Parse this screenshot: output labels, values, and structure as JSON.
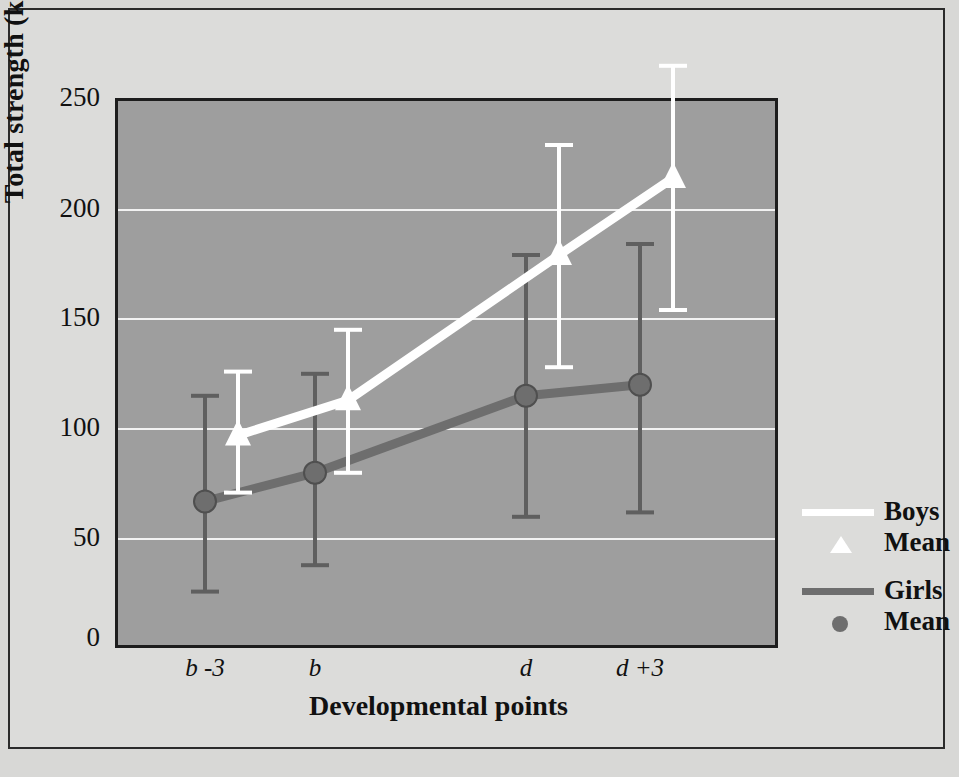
{
  "chart_data": {
    "type": "line",
    "title": "",
    "xlabel": "Developmental points",
    "ylabel": "Total strength (kg)",
    "categories": [
      "b -3",
      "b",
      "d",
      "d +3"
    ],
    "ylim": [
      0,
      250
    ],
    "yticks": [
      0,
      50,
      100,
      150,
      200,
      250
    ],
    "grid": "horizontal-white-dotted",
    "legend_position": "right",
    "plot_background": "#9e9e9e",
    "series": [
      {
        "name": "Boys",
        "marker": "triangle",
        "marker_label": "Mean",
        "color": "#ffffff",
        "values": [
          93,
          109,
          175,
          210
        ],
        "error_low": [
          67,
          76,
          124,
          150
        ],
        "error_high": [
          122,
          141,
          225,
          261
        ]
      },
      {
        "name": "Girls",
        "marker": "circle",
        "marker_label": "Mean",
        "color": "#6e6e6e",
        "values": [
          63,
          76,
          111,
          116
        ],
        "error_low": [
          22,
          34,
          56,
          58
        ],
        "error_high": [
          111,
          121,
          175,
          180
        ]
      }
    ]
  },
  "axis": {
    "y_tick_labels": [
      "250",
      "200",
      "150",
      "100",
      "50",
      "0"
    ],
    "x_tick_labels": [
      "b -3",
      "b",
      "d",
      "d +3"
    ],
    "y_title": "Total strength (kg)",
    "x_title": "Developmental points"
  },
  "legend": {
    "entries": [
      {
        "label": "Boys",
        "marker_label": "Mean",
        "color": "#ffffff",
        "marker": "triangle-icon"
      },
      {
        "label": "Girls",
        "marker_label": "Mean",
        "color": "#6e6e6e",
        "marker": "circle-icon"
      }
    ]
  },
  "colors": {
    "page": "#d8d8d6",
    "frame": "#2b2b2b",
    "plot_bg": "#9e9e9e",
    "plot_border": "#1d1d1d",
    "grid": "#f2f2f2",
    "boys": "#ffffff",
    "girls": "#6e6e6e"
  }
}
